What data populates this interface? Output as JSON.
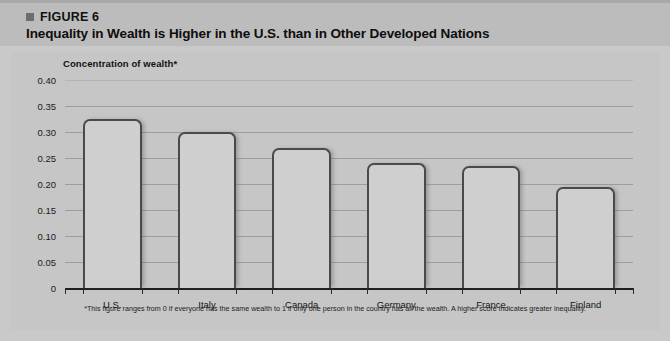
{
  "figure": {
    "label": "FIGURE 6",
    "title": "Inequality in Wealth is Higher in the U.S. than in Other Developed Nations",
    "bullet_icon": "square-bullet-icon"
  },
  "footnote": "*This figure ranges from 0 if everyone has the same wealth to 1 if only one person in the country has all the wealth. A higher score indicates greater inequality.",
  "colors": {
    "page_background": "#c9c9c9",
    "header_band": "#bcbcbc",
    "plot_background": "#c6c6c6",
    "bar_fill": "#cfcfcf",
    "bar_outline": "#4a4a4a",
    "gridline": "#9d9d9d",
    "axis_line": "#1e1e1e",
    "text": "#111111"
  },
  "chart_data": {
    "type": "bar",
    "title": "Inequality in Wealth is Higher in the U.S. than in Other Developed Nations",
    "subtitle": "FIGURE 6",
    "ylabel": "Concentration of wealth*",
    "xlabel": "",
    "categories": [
      "U.S.",
      "Italy",
      "Canada",
      "Germany",
      "France",
      "Finland"
    ],
    "values": [
      0.325,
      0.3,
      0.27,
      0.24,
      0.235,
      0.195
    ],
    "ylim": [
      0,
      0.4
    ],
    "yticks": [
      0,
      0.05,
      0.1,
      0.15,
      0.2,
      0.25,
      0.3,
      0.35,
      0.4
    ],
    "ytick_labels": [
      "0",
      "0.05",
      "0.10",
      "0.15",
      "0.20",
      "0.25",
      "0.30",
      "0.35",
      "0.40"
    ],
    "grid": true,
    "legend": false,
    "legend_position": "none",
    "annotations": [
      "*This figure ranges from 0 if everyone has the same wealth to 1 if only one person in the country has all the wealth. A higher score indicates greater inequality."
    ]
  }
}
